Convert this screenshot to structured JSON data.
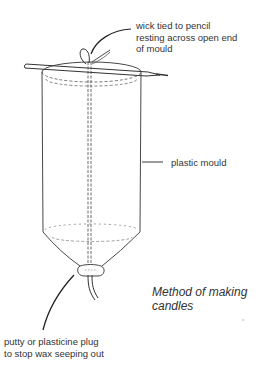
{
  "diagram": {
    "title_lines": [
      "Method of making",
      "candles"
    ],
    "labels": {
      "wick": [
        "wick tied to pencil",
        "resting across open end",
        "of mould"
      ],
      "mould": [
        "plastic mould"
      ],
      "plug": [
        "putty or plasticine plug",
        "to stop wax seeping out"
      ]
    },
    "parts": [
      "pencil",
      "wick",
      "plastic-mould",
      "putty-plug"
    ],
    "colors": {
      "line": "#333333",
      "dashed": "#555555",
      "background": "#ffffff"
    }
  }
}
